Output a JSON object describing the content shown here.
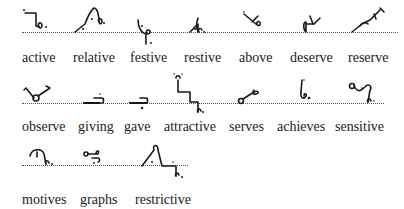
{
  "rows": [
    {
      "words": [
        "active",
        "relative",
        "festive",
        "restive",
        "above",
        "deserve",
        "reserve"
      ]
    },
    {
      "words": [
        "observe",
        "giving",
        "gave",
        "attractive",
        "serves",
        "achieves",
        "sensitive"
      ]
    },
    {
      "words": [
        "motives",
        "graphs",
        "restrictive"
      ]
    }
  ],
  "outline_icons": [
    [
      "active-outline-icon",
      "relative-outline-icon",
      "festive-outline-icon",
      "restive-outline-icon",
      "above-outline-icon",
      "deserve-outline-icon",
      "reserve-outline-icon"
    ],
    [
      "observe-outline-icon",
      "giving-outline-icon",
      "gave-outline-icon",
      "attractive-outline-icon",
      "serves-outline-icon",
      "achieves-outline-icon",
      "sensitive-outline-icon"
    ],
    [
      "motives-outline-icon",
      "graphs-outline-icon",
      "restrictive-outline-icon"
    ]
  ],
  "colors": {
    "ink": "#1a1a1a",
    "baseline": "#555555",
    "background": "#ffffff"
  }
}
